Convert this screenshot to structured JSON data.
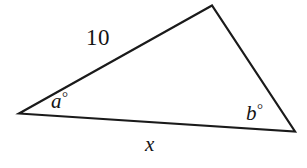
{
  "figure": {
    "kind": "geometry-diagram",
    "shape": "triangle",
    "background_color": "#ffffff",
    "stroke_color": "#1a1a1a",
    "stroke_width": 2.2,
    "width": 307,
    "height": 168,
    "vertices": {
      "left": {
        "x": 19,
        "y": 113
      },
      "top": {
        "x": 212,
        "y": 5
      },
      "right": {
        "x": 295,
        "y": 132
      }
    },
    "edges": [
      {
        "name": "upper-left-side",
        "from": "left",
        "to": "top",
        "label": "10"
      },
      {
        "name": "right-side",
        "from": "top",
        "to": "right",
        "label": ""
      },
      {
        "name": "bottom-side",
        "from": "left",
        "to": "right",
        "label": "x"
      }
    ],
    "labels": {
      "side_known": "10",
      "side_unknown": "x",
      "angle_left": "a",
      "angle_right": "b",
      "degree_symbol": "°"
    }
  },
  "chart_data": {
    "type": "diagram",
    "title": "",
    "annotations": [
      {
        "name": "side-length-10",
        "text": "10",
        "x": 104,
        "y": 40
      },
      {
        "name": "angle-a",
        "text": "a°",
        "x": 62,
        "y": 101
      },
      {
        "name": "angle-b",
        "text": "b°",
        "x": 262,
        "y": 114
      },
      {
        "name": "side-x",
        "text": "x",
        "x": 152,
        "y": 145
      }
    ]
  }
}
